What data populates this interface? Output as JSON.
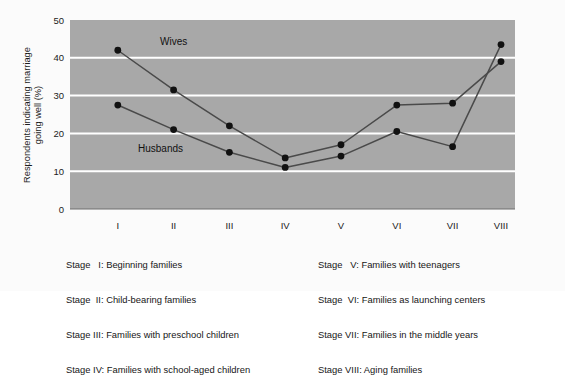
{
  "chart_data": {
    "type": "line",
    "title": "",
    "xlabel": "",
    "ylabel": "Respondents indicating marriage going well (%)",
    "categories": [
      "I",
      "II",
      "III",
      "IV",
      "V",
      "VI",
      "VII",
      "VIII"
    ],
    "ylim": [
      0,
      50
    ],
    "yticks": [
      0,
      10,
      20,
      30,
      40,
      50
    ],
    "grid": "horizontal-white-gridlines",
    "legend_position": "inline-annotations",
    "plot_background": "#a8a8a8",
    "gridline_color": "#ffffff",
    "series_color": "#4a4a4a",
    "marker_color": "#111111",
    "series": [
      {
        "name": "Wives",
        "values": [
          42.0,
          31.5,
          22.0,
          13.5,
          17.0,
          27.5,
          28.0,
          39.0
        ]
      },
      {
        "name": "Husbands",
        "values": [
          27.5,
          21.0,
          15.0,
          11.0,
          14.0,
          20.5,
          16.5,
          43.5
        ]
      }
    ],
    "annotations": [
      {
        "text": "Wives",
        "x_stage": "I-II",
        "value_near": 37
      },
      {
        "text": "Husbands",
        "x_stage": "I-II",
        "value_near": 18
      }
    ]
  },
  "axis": {
    "y_tick_labels": [
      "50",
      "40",
      "30",
      "20",
      "10",
      "0"
    ],
    "y_title_line1": "Respondents indicating marriage",
    "y_title_line2": "going well (%)",
    "x_tick_labels": [
      "I",
      "II",
      "III",
      "IV",
      "V",
      "VI",
      "VII",
      "VIII"
    ]
  },
  "series_labels": {
    "wives": "Wives",
    "husbands": "Husbands"
  },
  "legend": {
    "left_column": [
      "Stage   I: Beginning families",
      "Stage  II: Child-bearing families",
      "Stage III: Families with preschool children",
      "Stage IV: Families with school-aged children"
    ],
    "right_column": [
      "Stage   V: Families with teenagers",
      "Stage  VI: Families as launching centers",
      "Stage VII: Families in the middle years",
      "Stage VIII: Aging families"
    ]
  }
}
